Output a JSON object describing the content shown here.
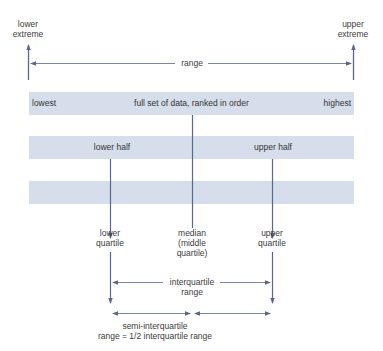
{
  "diagram": {
    "type": "quartiles-explanation",
    "colors": {
      "band_fill": "#d6deeb",
      "line": "#5a6591",
      "text": "#3c3c3c",
      "background": "#ffffff"
    },
    "extremes": {
      "lower_line1": "lower",
      "lower_line2": "extreme",
      "upper_line1": "upper",
      "upper_line2": "extreme"
    },
    "range_label": "range",
    "bands": {
      "full": {
        "left": "lowest",
        "center": "full set of data, ranked in order",
        "right": "highest"
      },
      "halves": {
        "lower": "lower half",
        "upper": "upper half"
      }
    },
    "quartiles": {
      "lower_line1": "lower",
      "lower_line2": "quartile",
      "median_line1": "median",
      "median_line2": "(middle",
      "median_line3": "quartile)",
      "upper_line1": "upper",
      "upper_line2": "quartile"
    },
    "interquartile": {
      "line1": "interquartile",
      "line2": "range"
    },
    "semi_interquartile": {
      "line1": "semi-interquartile",
      "line2": "range = 1/2 interquartile range"
    }
  }
}
